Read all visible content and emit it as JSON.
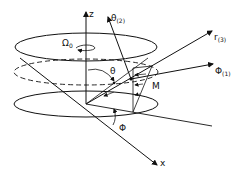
{
  "diagram": {
    "type": "spherical-coordinate-rotation-diagram",
    "labels": {
      "z_axis": "z",
      "x_axis": "x",
      "theta_unit": "θ",
      "theta_unit_sub": "(2)",
      "r_unit": "r",
      "r_unit_sub": "(3)",
      "phi_unit": "Φ",
      "phi_unit_sub": "(1)",
      "theta_angle": "θ",
      "phi_angle": "Φ",
      "omega": "Ω",
      "omega_sub": "0",
      "point": "M"
    },
    "colors": {
      "stroke": "#111111",
      "background": "#ffffff"
    }
  }
}
